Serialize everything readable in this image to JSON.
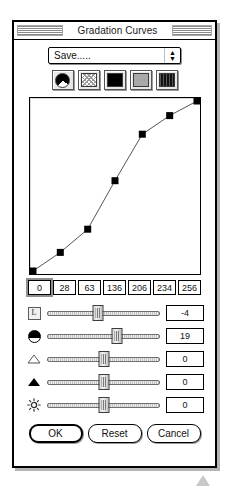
{
  "window": {
    "title": "Gradation Curves"
  },
  "preset": {
    "label": "Save.....",
    "spinner_up": "▲",
    "spinner_down": "▼"
  },
  "mode_buttons": [
    {
      "name": "channel-composite-button",
      "icon": "pie-icon"
    },
    {
      "name": "channel-dither-button",
      "icon": "dither-swatch-icon"
    },
    {
      "name": "channel-black-button",
      "icon": "black-swatch-icon"
    },
    {
      "name": "channel-gray-button",
      "icon": "gray-swatch-icon"
    },
    {
      "name": "channel-stripe-button",
      "icon": "stripe-swatch-icon"
    }
  ],
  "chart_data": {
    "type": "line",
    "title": "Gradation Curves",
    "xlabel": "",
    "ylabel": "",
    "xlim": [
      0,
      6
    ],
    "ylim": [
      0,
      256
    ],
    "grid": false,
    "legend": null,
    "x": [
      0,
      1,
      2,
      3,
      4,
      5,
      6
    ],
    "values": [
      0,
      28,
      63,
      136,
      206,
      234,
      256
    ],
    "point_markers": "square",
    "series": [
      {
        "name": "gradation",
        "values": [
          0,
          28,
          63,
          136,
          206,
          234,
          256
        ]
      }
    ]
  },
  "curve_values": [
    "0",
    "28",
    "63",
    "136",
    "206",
    "234",
    "256"
  ],
  "curve_focused_index": 0,
  "sliders": [
    {
      "name": "contrast-slider",
      "icon": "letter-l-icon",
      "value": "-4",
      "percent": 45
    },
    {
      "name": "density-slider",
      "icon": "dome-icon",
      "value": "19",
      "percent": 62
    },
    {
      "name": "highlight-slider",
      "icon": "triangle-open-icon",
      "value": "0",
      "percent": 50
    },
    {
      "name": "shadow-slider",
      "icon": "triangle-fill-icon",
      "value": "0",
      "percent": 50
    },
    {
      "name": "brightness-slider",
      "icon": "sun-icon",
      "value": "0",
      "percent": 50
    }
  ],
  "buttons": {
    "ok": "OK",
    "reset": "Reset",
    "cancel": "Cancel"
  },
  "colors": {
    "window_bg": "#ffffff",
    "border": "#000000",
    "shadow": "#b4b4b4",
    "track": "#c2c2c2",
    "text": "#111111"
  }
}
